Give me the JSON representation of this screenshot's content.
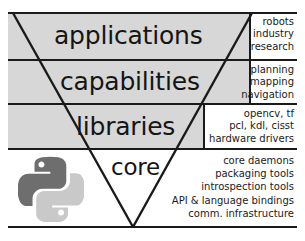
{
  "diagram": {
    "shape": "inverted-triangle",
    "colors": {
      "band_fill": "#d7d7d7",
      "core_fill": "#ffffff",
      "stroke": "#1a1a1a",
      "python_dark": "#6e6e6e",
      "python_light": "#c9c9c9"
    },
    "layers": [
      {
        "id": "applications",
        "label": "applications",
        "fill": "#d7d7d7",
        "examples": [
          "robots",
          "industry",
          "research"
        ]
      },
      {
        "id": "capabilities",
        "label": "capabilities",
        "fill": "#d7d7d7",
        "examples": [
          "planning",
          "mapping",
          "navigation"
        ]
      },
      {
        "id": "libraries",
        "label": "libraries",
        "fill": "#d7d7d7",
        "examples": [
          "opencv, tf",
          "pcl, kdl, cisst",
          "hardware drivers"
        ]
      },
      {
        "id": "core",
        "label": "core",
        "fill": "#ffffff",
        "examples": [
          "core daemons",
          "packaging tools",
          "introspection tools",
          "API & language bindings",
          "comm. infrastructure"
        ]
      }
    ],
    "logo": {
      "name": "python-logo",
      "label": "Python"
    }
  }
}
